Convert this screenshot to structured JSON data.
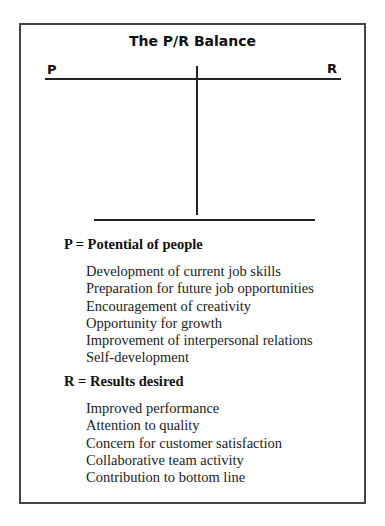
{
  "title": "The P/R Balance",
  "balance": {
    "left_label": "P",
    "right_label": "R"
  },
  "sections": [
    {
      "heading": "P = Potential of people",
      "items": [
        "Development of current job skills",
        "Preparation for future job opportunities",
        "Encouragement of creativity",
        "Opportunity for growth",
        "Improvement of interpersonal relations",
        "Self-development"
      ]
    },
    {
      "heading": "R = Results desired",
      "items": [
        "Improved performance",
        "Attention to quality",
        "Concern for customer satisfaction",
        "Collaborative team activity",
        "Contribution to bottom line"
      ]
    }
  ]
}
